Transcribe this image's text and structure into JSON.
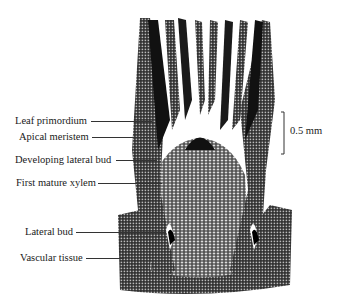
{
  "figure": {
    "labels": [
      {
        "text": "Leaf primordium",
        "x": 15,
        "y": 115,
        "line_x1": 91,
        "line_x2": 152,
        "line_y": 121
      },
      {
        "text": "Apical meristem",
        "x": 19,
        "y": 131,
        "line_x1": 92,
        "line_x2": 153,
        "line_y": 137
      },
      {
        "text": "Developing lateral bud",
        "x": 15,
        "y": 154,
        "line_x1": 116,
        "line_x2": 157,
        "line_y": 160
      },
      {
        "text": "First mature xylem",
        "x": 16,
        "y": 177,
        "line_x1": 98,
        "line_x2": 162,
        "line_y": 183
      },
      {
        "text": "Lateral bud",
        "x": 25,
        "y": 226,
        "line_x1": 76,
        "line_x2": 166,
        "line_y": 232
      },
      {
        "text": "Vascular tissue",
        "x": 20,
        "y": 252,
        "line_x1": 86,
        "line_x2": 124,
        "line_y": 258
      }
    ],
    "scale_bar": {
      "label": "0.5 mm",
      "length_px": 42
    }
  },
  "colors": {
    "ink": "#1a1a1a",
    "tissue_dark": "#111111",
    "tissue_mid": "#555555",
    "background": "#ffffff"
  }
}
